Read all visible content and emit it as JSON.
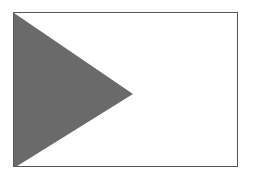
{
  "figure": {
    "caption": "",
    "frame": {
      "border_color": "#555555",
      "background": "#ffffff"
    },
    "triangle": {
      "shape": "right-pointing-triangle",
      "fill_color": "#6a6a6a",
      "points": "0,0 119,81 0,155"
    }
  }
}
